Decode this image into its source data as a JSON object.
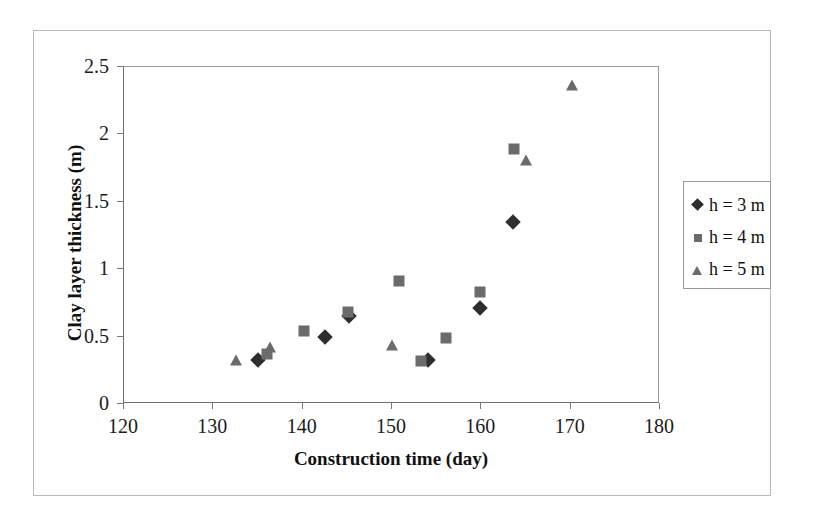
{
  "chart_data": {
    "type": "scatter",
    "title": "",
    "xlabel": "Construction time (day)",
    "ylabel": "Clay layer thickness (m)",
    "xlim": [
      120,
      180
    ],
    "ylim": [
      0,
      2.5
    ],
    "xticks": [
      "120",
      "130",
      "140",
      "150",
      "160",
      "170",
      "180"
    ],
    "xtick_values": [
      120,
      130,
      140,
      150,
      160,
      170,
      180
    ],
    "yticks": [
      "0",
      "0.5",
      "1",
      "1.5",
      "2",
      "2.5"
    ],
    "ytick_values": [
      0,
      0.5,
      1,
      1.5,
      2,
      2.5
    ],
    "grid": false,
    "legend_position": "right",
    "series": [
      {
        "name": "h = 3 m",
        "marker": "diamond",
        "color": "#2e2e2e",
        "points": [
          [
            135.0,
            0.33
          ],
          [
            142.5,
            0.5
          ],
          [
            145.2,
            0.65
          ],
          [
            154.0,
            0.33
          ],
          [
            159.9,
            0.71
          ],
          [
            163.5,
            1.35
          ]
        ]
      },
      {
        "name": "h = 4 m",
        "marker": "square",
        "color": "#6b6b6b",
        "points": [
          [
            136.0,
            0.37
          ],
          [
            140.1,
            0.54
          ],
          [
            145.1,
            0.68
          ],
          [
            150.8,
            0.91
          ],
          [
            153.2,
            0.32
          ],
          [
            156.1,
            0.49
          ],
          [
            159.8,
            0.83
          ],
          [
            163.7,
            1.89
          ]
        ]
      },
      {
        "name": "h = 5 m",
        "marker": "triangle",
        "color": "#6b6b6b",
        "points": [
          [
            132.5,
            0.33
          ],
          [
            136.3,
            0.42
          ],
          [
            150.0,
            0.44
          ],
          [
            165.0,
            1.81
          ],
          [
            170.2,
            2.37
          ]
        ]
      }
    ]
  },
  "legend": {
    "entries": [
      {
        "label": "h = 3 m",
        "marker": "diamond"
      },
      {
        "label": "h = 4 m",
        "marker": "square"
      },
      {
        "label": "h = 5 m",
        "marker": "triangle"
      }
    ]
  }
}
